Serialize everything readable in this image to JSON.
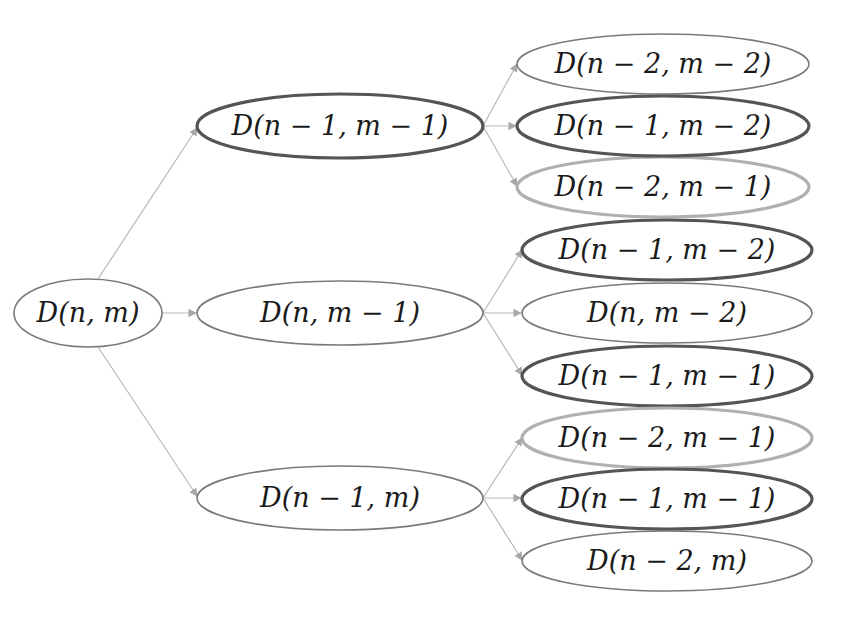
{
  "diagram": {
    "type": "tree",
    "style": {
      "background": "#ffffff",
      "edge_color": "#b8b8b8",
      "outline_thin": "#7a7a7a",
      "outline_thick_dark": "#555555",
      "outline_thick_light": "#b0b0b0",
      "text_color": "#1a1a1a"
    },
    "nodes": [
      {
        "id": "root",
        "label": "D(n, m)",
        "cx": 88,
        "cy": 313,
        "rx": 74,
        "ry": 34,
        "outline": "thin"
      },
      {
        "id": "l1-a",
        "label": "D(n − 1, m − 1)",
        "cx": 340,
        "cy": 126,
        "rx": 143,
        "ry": 32,
        "outline": "thick_dark"
      },
      {
        "id": "l1-b",
        "label": "D(n, m − 1)",
        "cx": 340,
        "cy": 313,
        "rx": 143,
        "ry": 32,
        "outline": "thin"
      },
      {
        "id": "l1-c",
        "label": "D(n − 1, m)",
        "cx": 340,
        "cy": 498,
        "rx": 143,
        "ry": 32,
        "outline": "thin"
      },
      {
        "id": "l2-a1",
        "label": "D(n − 2, m − 2)",
        "cx": 663,
        "cy": 64,
        "rx": 146,
        "ry": 30,
        "outline": "thin"
      },
      {
        "id": "l2-a2",
        "label": "D(n − 1, m − 2)",
        "cx": 663,
        "cy": 126,
        "rx": 146,
        "ry": 30,
        "outline": "thick_dark"
      },
      {
        "id": "l2-a3",
        "label": "D(n − 2, m − 1)",
        "cx": 663,
        "cy": 187,
        "rx": 146,
        "ry": 30,
        "outline": "thick_light"
      },
      {
        "id": "l2-b1",
        "label": "D(n − 1, m − 2)",
        "cx": 667,
        "cy": 250,
        "rx": 145,
        "ry": 30,
        "outline": "thick_dark"
      },
      {
        "id": "l2-b2",
        "label": "D(n, m − 2)",
        "cx": 667,
        "cy": 313,
        "rx": 145,
        "ry": 30,
        "outline": "thin"
      },
      {
        "id": "l2-b3",
        "label": "D(n − 1, m − 1)",
        "cx": 667,
        "cy": 376,
        "rx": 145,
        "ry": 30,
        "outline": "thick_dark"
      },
      {
        "id": "l2-c1",
        "label": "D(n − 2, m − 1)",
        "cx": 667,
        "cy": 438,
        "rx": 145,
        "ry": 30,
        "outline": "thick_light"
      },
      {
        "id": "l2-c2",
        "label": "D(n − 1, m − 1)",
        "cx": 667,
        "cy": 499,
        "rx": 145,
        "ry": 30,
        "outline": "thick_dark"
      },
      {
        "id": "l2-c3",
        "label": "D(n − 2, m)",
        "cx": 667,
        "cy": 561,
        "rx": 145,
        "ry": 30,
        "outline": "thin"
      }
    ],
    "edges": [
      {
        "from": "root",
        "to": "l1-a"
      },
      {
        "from": "root",
        "to": "l1-b"
      },
      {
        "from": "root",
        "to": "l1-c"
      },
      {
        "from": "l1-a",
        "to": "l2-a1"
      },
      {
        "from": "l1-a",
        "to": "l2-a2"
      },
      {
        "from": "l1-a",
        "to": "l2-a3"
      },
      {
        "from": "l1-b",
        "to": "l2-b1"
      },
      {
        "from": "l1-b",
        "to": "l2-b2"
      },
      {
        "from": "l1-b",
        "to": "l2-b3"
      },
      {
        "from": "l1-c",
        "to": "l2-c1"
      },
      {
        "from": "l1-c",
        "to": "l2-c2"
      },
      {
        "from": "l1-c",
        "to": "l2-c3"
      }
    ]
  },
  "labels": {
    "root": "D(n, m)",
    "l1_a": "D(n − 1, m − 1)",
    "l1_b": "D(n, m − 1)",
    "l1_c": "D(n − 1, m)",
    "l2_a1": "D(n − 2, m − 2)",
    "l2_a2": "D(n − 1, m − 2)",
    "l2_a3": "D(n − 2, m − 1)",
    "l2_b1": "D(n − 1, m − 2)",
    "l2_b2": "D(n, m − 2)",
    "l2_b3": "D(n − 1, m − 1)",
    "l2_c1": "D(n − 2, m − 1)",
    "l2_c2": "D(n − 1, m − 1)",
    "l2_c3": "D(n − 2, m)"
  }
}
